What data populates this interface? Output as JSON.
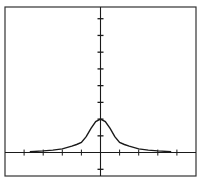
{
  "chart_data": {
    "type": "line",
    "title": "",
    "xlabel": "",
    "ylabel": "",
    "xlim": [
      -5.0,
      5.0
    ],
    "ylim": [
      -1.4,
      8.7
    ],
    "x_ticks": [
      -4,
      -3,
      -2,
      -1,
      1,
      2,
      3,
      4
    ],
    "y_ticks": [
      -1,
      1,
      2,
      3,
      4,
      5,
      6,
      7,
      8
    ],
    "grid": false,
    "legend": null,
    "series": [
      {
        "name": "f(x)",
        "x": [
          -3.7,
          -3.0,
          -2.5,
          -2.0,
          -1.5,
          -1.25,
          -1.0,
          -0.75,
          -0.5,
          -0.25,
          0,
          0.25,
          0.5,
          0.75,
          1.0,
          1.25,
          1.5,
          2.0,
          2.5,
          3.0,
          3.7
        ],
        "y": [
          0.05,
          0.1,
          0.15,
          0.22,
          0.38,
          0.48,
          0.6,
          0.95,
          1.45,
          1.85,
          2.0,
          1.85,
          1.45,
          0.95,
          0.6,
          0.48,
          0.38,
          0.22,
          0.15,
          0.1,
          0.05
        ]
      }
    ]
  },
  "colors": {
    "background": "#ffffff",
    "ink": "#1a1a1a",
    "frame": "#333333"
  }
}
